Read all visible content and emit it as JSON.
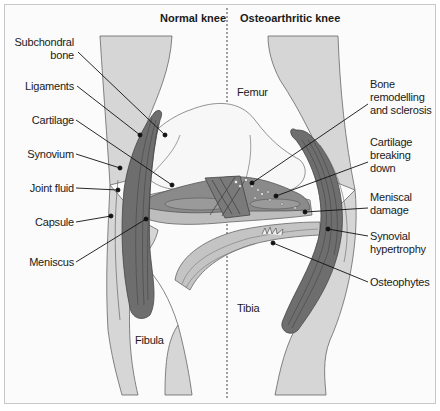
{
  "titles": {
    "left": "Normal knee",
    "right": "Osteoarthritic knee"
  },
  "left_labels": [
    {
      "line1": "Subchondral",
      "line2": "bone"
    },
    {
      "line1": "Ligaments"
    },
    {
      "line1": "Cartilage"
    },
    {
      "line1": "Synovium"
    },
    {
      "line1": "Joint fluid"
    },
    {
      "line1": "Capsule"
    },
    {
      "line1": "Meniscus"
    }
  ],
  "right_labels": [
    {
      "line1": "Bone",
      "line2": "remodelling",
      "line3": "and sclerosis"
    },
    {
      "line1": "Cartilage",
      "line2": "breaking",
      "line3": "down"
    },
    {
      "line1": "Meniscal",
      "line2": "damage"
    },
    {
      "line1": "Synovial",
      "line2": "hypertrophy"
    },
    {
      "line1": "Osteophytes"
    }
  ],
  "bone_labels": {
    "femur": "Femur",
    "tibia": "Tibia",
    "fibula": "Fibula"
  },
  "colors": {
    "bone_fill": "#d6d6d6",
    "ligament_fill": "#6e6e6e",
    "cartilage_fill": "#8a8a8a",
    "meniscus_fill": "#bdbdbd",
    "outline": "#555555",
    "leader": "#111111"
  }
}
